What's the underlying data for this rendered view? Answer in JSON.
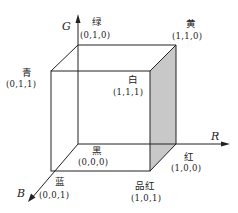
{
  "diagram": {
    "type": "rgb-color-cube",
    "colors": {
      "line": "#222222",
      "shaded_face": "#c8c8c8",
      "background": "#ffffff"
    },
    "axes": [
      {
        "id": "G",
        "label": "G"
      },
      {
        "id": "R",
        "label": "R"
      },
      {
        "id": "B",
        "label": "B"
      }
    ],
    "vertices": [
      {
        "id": "green",
        "name": "绿",
        "coord": "(0,1,0)"
      },
      {
        "id": "yellow",
        "name": "黄",
        "coord": "(1,1,0)"
      },
      {
        "id": "cyan",
        "name": "青",
        "coord": "(0,1,1)"
      },
      {
        "id": "white",
        "name": "白",
        "coord": "(1,1,1)"
      },
      {
        "id": "black",
        "name": "黑",
        "coord": "(0,0,0)"
      },
      {
        "id": "red",
        "name": "红",
        "coord": "(1,0,0)"
      },
      {
        "id": "blue",
        "name": "蓝",
        "coord": "(0,0,1)"
      },
      {
        "id": "magenta",
        "name": "品红",
        "coord": "(1,0,1)"
      }
    ]
  }
}
